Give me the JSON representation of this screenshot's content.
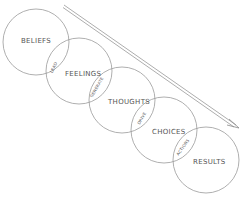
{
  "diagram": {
    "type": "overlapping-circle-chain",
    "colors": {
      "stroke": "#9a9a9a",
      "text": "#555555",
      "background": "#ffffff"
    },
    "circles": [
      {
        "id": "beliefs",
        "label": "BELIEFS",
        "cx": 36,
        "cy": 42,
        "r": 33
      },
      {
        "id": "feelings",
        "label": "FEELINGS",
        "cx": 79,
        "cy": 71,
        "r": 33
      },
      {
        "id": "thoughts",
        "label": "THOUGHTS",
        "cx": 122,
        "cy": 100,
        "r": 33
      },
      {
        "id": "choices",
        "label": "CHOICES",
        "cx": 164,
        "cy": 130,
        "r": 33
      },
      {
        "id": "results",
        "label": "RESULTS",
        "cx": 206,
        "cy": 160,
        "r": 33
      }
    ],
    "intersections": [
      {
        "between": [
          "beliefs",
          "feelings"
        ],
        "label": "LEAD"
      },
      {
        "between": [
          "feelings",
          "thoughts"
        ],
        "label": "GENERATE"
      },
      {
        "between": [
          "thoughts",
          "choices"
        ],
        "label": "DRIVE"
      },
      {
        "between": [
          "choices",
          "results"
        ],
        "label": "ACTIONS"
      }
    ],
    "arrow": {
      "from": [
        64,
        6
      ],
      "to": [
        238,
        128
      ],
      "style": "double-line"
    }
  }
}
